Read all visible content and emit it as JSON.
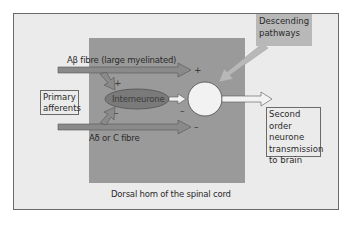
{
  "diagram": {
    "labels": {
      "primary_afferents": [
        "Primary",
        "afferents"
      ],
      "ab_fibre": "Aβ fibre (large myelinated)",
      "ad_fibre": "Aδ or C fibre",
      "interneurone": "Interneurone",
      "descending": [
        "Descending",
        "pathways"
      ],
      "second_order": [
        "Second order",
        "neurone",
        "transmission",
        "to brain"
      ],
      "dorsal_horn": "Dorsal hom of the spinal cord"
    },
    "signs": {
      "ab_to_cell": "+",
      "ab_to_inter": "+",
      "ad_to_inter": "–",
      "inter_to_cell": "–",
      "ad_to_cell": "–"
    },
    "colors": {
      "frame_bg": "#ebebeb",
      "dorsal_bg": "#9a9a9a",
      "arrow_fill": "#8a8a8a",
      "interneurone_fill": "#7a7a7a",
      "descending_bg": "#b8b8b8",
      "cell_fill": "#f2f2f2"
    }
  }
}
